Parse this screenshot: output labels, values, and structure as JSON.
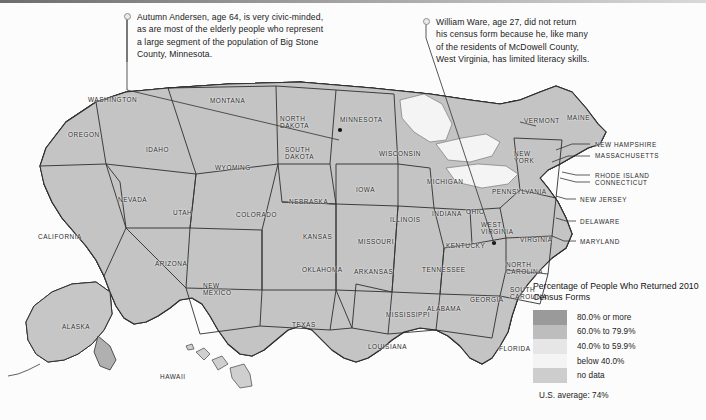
{
  "figure": {
    "kind": "choropleth-map",
    "region": "United States, county level"
  },
  "annotations": [
    {
      "id": "autumn-andersen",
      "text": "Autumn Andersen, age 64, is very civic-minded,\nas are most of the elderly people who represent\na large segment of the population of Big Stone\nCounty, Minnesota.",
      "target": "Big Stone County, Minnesota"
    },
    {
      "id": "william-ware",
      "text": "William Ware, age 27, did not return\nhis census form because he, like many\nof the residents of McDowell County,\nWest Virginia, has limited literacy skills.",
      "target": "McDowell County, West Virginia"
    }
  ],
  "legend": {
    "title": "Percentage of People Who\nReturned 2010 Census Forms",
    "items": [
      {
        "label": "80.0% or more",
        "color": "#9a9a9a"
      },
      {
        "label": "60.0% to 79.9%",
        "color": "#bdbdbd"
      },
      {
        "label": "40.0% to 59.9%",
        "color": "#e6e6e6"
      },
      {
        "label": "below 40.0%",
        "color": "#f4f4f4"
      },
      {
        "label": "no data",
        "color": "#cdcdcd"
      }
    ],
    "average_note": "U.S. average: 74%"
  },
  "state_labels": [
    {
      "name": "WASHINGTON",
      "x": 88,
      "y": 18,
      "align": "left"
    },
    {
      "name": "OREGON",
      "x": 68,
      "y": 53,
      "align": "left"
    },
    {
      "name": "IDAHO",
      "x": 146,
      "y": 68,
      "align": "left"
    },
    {
      "name": "MONTANA",
      "x": 210,
      "y": 19,
      "align": "left"
    },
    {
      "name": "NORTH\nDAKOTA",
      "x": 280,
      "y": 37,
      "align": "left"
    },
    {
      "name": "SOUTH\nDAKOTA",
      "x": 285,
      "y": 68,
      "align": "left"
    },
    {
      "name": "MINNESOTA",
      "x": 340,
      "y": 38,
      "align": "left"
    },
    {
      "name": "WISCONSIN",
      "x": 379,
      "y": 72,
      "align": "left"
    },
    {
      "name": "WYOMING",
      "x": 215,
      "y": 86,
      "align": "left"
    },
    {
      "name": "NEVADA",
      "x": 118,
      "y": 118,
      "align": "left"
    },
    {
      "name": "UTAH",
      "x": 173,
      "y": 131,
      "align": "left"
    },
    {
      "name": "COLORADO",
      "x": 236,
      "y": 133,
      "align": "left"
    },
    {
      "name": "NEBRASKA",
      "x": 289,
      "y": 120,
      "align": "left"
    },
    {
      "name": "IOWA",
      "x": 356,
      "y": 108,
      "align": "left"
    },
    {
      "name": "ILLINOIS",
      "x": 390,
      "y": 138,
      "align": "left"
    },
    {
      "name": "MICHIGAN",
      "x": 427,
      "y": 100,
      "align": "left"
    },
    {
      "name": "INDIANA",
      "x": 432,
      "y": 132,
      "align": "left"
    },
    {
      "name": "OHIO",
      "x": 466,
      "y": 130,
      "align": "left"
    },
    {
      "name": "PENNSYLVANIA",
      "x": 492,
      "y": 110,
      "align": "left"
    },
    {
      "name": "NEW\nYORK",
      "x": 514,
      "y": 72,
      "align": "left"
    },
    {
      "name": "VERMONT",
      "x": 524,
      "y": 39,
      "align": "left"
    },
    {
      "name": "MAINE",
      "x": 567,
      "y": 36,
      "align": "left"
    },
    {
      "name": "NEW HAMPSHIRE",
      "x": 595,
      "y": 63,
      "align": "left"
    },
    {
      "name": "MASSACHUSETTS",
      "x": 595,
      "y": 74,
      "align": "left"
    },
    {
      "name": "RHODE ISLAND",
      "x": 595,
      "y": 94,
      "align": "left"
    },
    {
      "name": "CONNECTICUT",
      "x": 595,
      "y": 101,
      "align": "left"
    },
    {
      "name": "NEW JERSEY",
      "x": 580,
      "y": 118,
      "align": "left"
    },
    {
      "name": "DELAWARE",
      "x": 580,
      "y": 140,
      "align": "left"
    },
    {
      "name": "MARYLAND",
      "x": 580,
      "y": 160,
      "align": "left"
    },
    {
      "name": "WEST\nVIRGINIA",
      "x": 481,
      "y": 143,
      "align": "left"
    },
    {
      "name": "VIRGINIA",
      "x": 520,
      "y": 158,
      "align": "left"
    },
    {
      "name": "KENTUCKY",
      "x": 446,
      "y": 164,
      "align": "left"
    },
    {
      "name": "MISSOURI",
      "x": 358,
      "y": 160,
      "align": "left"
    },
    {
      "name": "KANSAS",
      "x": 303,
      "y": 155,
      "align": "left"
    },
    {
      "name": "ARIZONA",
      "x": 155,
      "y": 182,
      "align": "left"
    },
    {
      "name": "CALIFORNIA",
      "x": 38,
      "y": 155,
      "align": "left"
    },
    {
      "name": "NEW\nMEXICO",
      "x": 203,
      "y": 204,
      "align": "left"
    },
    {
      "name": "OKLAHOMA",
      "x": 302,
      "y": 188,
      "align": "left"
    },
    {
      "name": "ARKANSAS",
      "x": 354,
      "y": 190,
      "align": "left"
    },
    {
      "name": "TENNESSEE",
      "x": 422,
      "y": 188,
      "align": "left"
    },
    {
      "name": "NORTH\nCAROLINA",
      "x": 506,
      "y": 183,
      "align": "left"
    },
    {
      "name": "SOUTH\nCAROLINA",
      "x": 510,
      "y": 208,
      "align": "left"
    },
    {
      "name": "GEORGIA",
      "x": 470,
      "y": 218,
      "align": "left"
    },
    {
      "name": "ALABAMA",
      "x": 427,
      "y": 227,
      "align": "left"
    },
    {
      "name": "MISSISSIPPI",
      "x": 386,
      "y": 233,
      "align": "left"
    },
    {
      "name": "LOUISIANA",
      "x": 368,
      "y": 265,
      "align": "left"
    },
    {
      "name": "TEXAS",
      "x": 292,
      "y": 243,
      "align": "left"
    },
    {
      "name": "FLORIDA",
      "x": 499,
      "y": 267,
      "align": "left"
    },
    {
      "name": "ALASKA",
      "x": 62,
      "y": 245,
      "align": "left"
    },
    {
      "name": "HAWAII",
      "x": 160,
      "y": 295,
      "align": "left"
    }
  ]
}
